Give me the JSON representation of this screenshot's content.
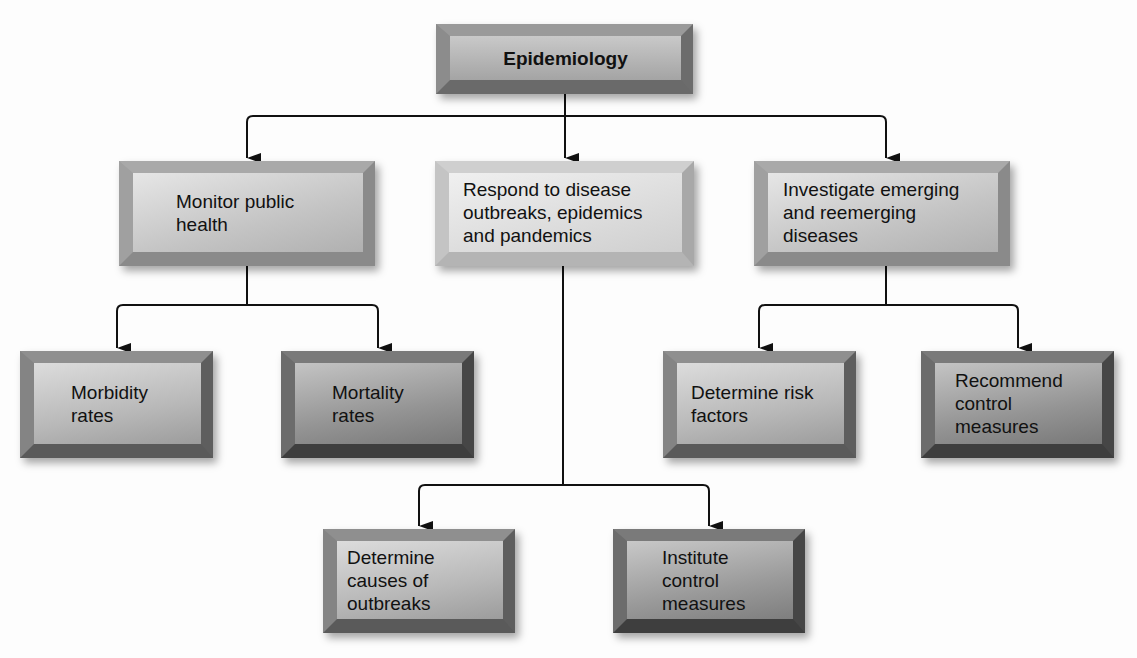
{
  "diagram": {
    "type": "hierarchy",
    "root": {
      "id": "epidemiology",
      "label": "Epidemiology",
      "bold": true,
      "children": [
        "monitor",
        "respond",
        "investigate"
      ]
    },
    "nodes": {
      "epidemiology": {
        "label": "Epidemiology"
      },
      "monitor": {
        "label": "Monitor public\nhealth",
        "children": [
          "morbidity",
          "mortality"
        ]
      },
      "respond": {
        "label": "Respond to disease\noutbreaks, epidemics\nand pandemics",
        "children": [
          "causes",
          "institute"
        ]
      },
      "investigate": {
        "label": "Investigate emerging\nand reemerging\ndiseases",
        "children": [
          "risk",
          "recommend"
        ]
      },
      "morbidity": {
        "label": "Morbidity\nrates"
      },
      "mortality": {
        "label": "Mortality\nrates"
      },
      "risk": {
        "label": "Determine risk\nfactors"
      },
      "recommend": {
        "label": "Recommend\ncontrol\nmeasures"
      },
      "causes": {
        "label": "Determine\ncauses of\noutbreaks"
      },
      "institute": {
        "label": "Institute\ncontrol\nmeasures"
      }
    },
    "edges": [
      [
        "epidemiology",
        "monitor"
      ],
      [
        "epidemiology",
        "respond"
      ],
      [
        "epidemiology",
        "investigate"
      ],
      [
        "monitor",
        "morbidity"
      ],
      [
        "monitor",
        "mortality"
      ],
      [
        "investigate",
        "risk"
      ],
      [
        "investigate",
        "recommend"
      ],
      [
        "respond",
        "causes"
      ],
      [
        "respond",
        "institute"
      ]
    ],
    "colors": {
      "line": "#111111",
      "bevel_light": "#bdbdbd",
      "bevel_dark": "#6e6e6e",
      "face_light": "#e6e6e6",
      "face_mid": "#a9a9a9",
      "face_dark": "#7d7d7d"
    }
  }
}
